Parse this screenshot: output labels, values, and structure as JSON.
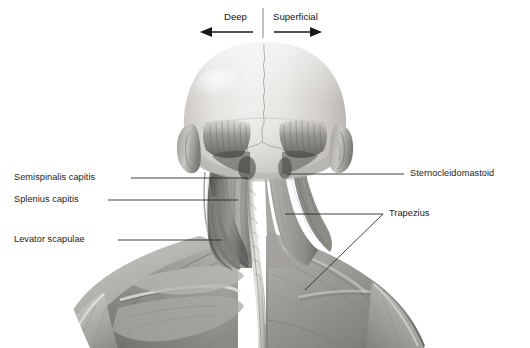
{
  "figure": {
    "background_color": "#ffffff",
    "width": 530,
    "height": 348
  },
  "orientation": {
    "deep_label": "Deep",
    "superficial_label": "Superficial",
    "divider_color": "#8c8c8c",
    "arrow_color": "#1a1a1a",
    "deep_side": "left",
    "superficial_side": "right"
  },
  "labels": {
    "left": [
      {
        "text": "Semispinalis capitis",
        "side": "left"
      },
      {
        "text": "Splenius capitis",
        "side": "left"
      },
      {
        "text": "Levator scapulae",
        "side": "left"
      }
    ],
    "right": [
      {
        "text": "Sternocleidomastoid",
        "side": "right"
      },
      {
        "text": "Trapezius",
        "side": "right"
      }
    ]
  },
  "leader_lines": {
    "color": "#2b2b2b",
    "width": 0.9
  },
  "anatomy": {
    "view": "posterior",
    "structures": [
      "cranium",
      "sagittal-suture",
      "occipital-muscle-attachment",
      "left-ear",
      "right-ear",
      "semispinalis-capitis",
      "splenius-capitis",
      "levator-scapulae",
      "sternocleidomastoid",
      "trapezius",
      "nuchal-midline",
      "deltoid",
      "rhomboid",
      "supraspinatus",
      "infraspinatus"
    ],
    "palette": {
      "skin_light": "#e8e6e3",
      "skull_light": "#dedbd7",
      "muscle_mid": "#9a9894",
      "muscle_dark": "#6e6c69",
      "muscle_deep": "#565451",
      "highlight": "#f2f1ef",
      "shadow": "#45433f"
    }
  }
}
